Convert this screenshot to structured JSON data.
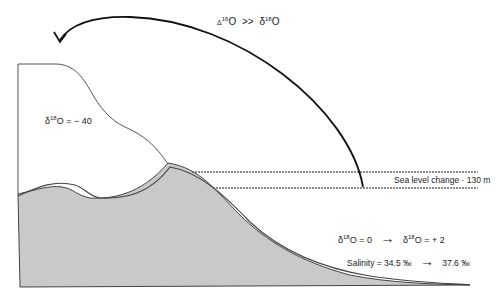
{
  "diagram": {
    "top_label": {
      "delta_prefix": "Δ",
      "iso1": "16",
      "o1": "O",
      "relation": ">>",
      "delta2": "δ",
      "iso2": "18",
      "o2": "O"
    },
    "ice_label": {
      "delta": "δ",
      "iso": "18",
      "text": "O = − 40"
    },
    "sea_level_label": "Sea level change · 130 m",
    "ocean_delta": {
      "from_delta": "δ",
      "from_iso": "18",
      "from_text": "O = 0",
      "arrow": "→",
      "to_delta": "δ",
      "to_iso": "18",
      "to_text": "O = + 2"
    },
    "salinity": {
      "from": "Salinity = 34.5 ‰",
      "arrow": "→",
      "to": "37.6 ‰"
    },
    "colors": {
      "land_fill": "#c8c8c8",
      "line": "#333333",
      "arrow": "#111111"
    }
  }
}
